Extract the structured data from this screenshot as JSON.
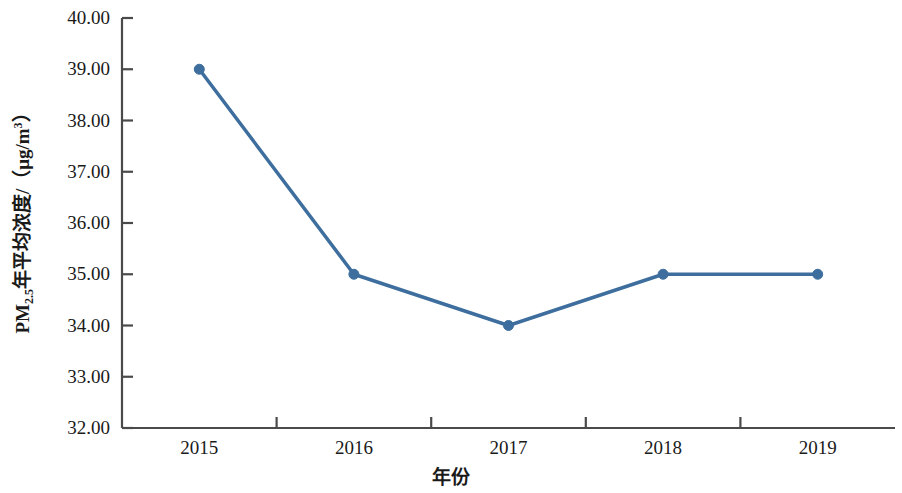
{
  "chart_data": {
    "type": "line",
    "title": "",
    "xlabel": "年份",
    "ylabel_html": "PM<sub>2.5</sub>年平均浓度/（μg/m<sup>3</sup>）",
    "ylabel_plain": "PM2.5年平均浓度/（μg/m3）",
    "categories": [
      "2015",
      "2016",
      "2017",
      "2018",
      "2019"
    ],
    "values": [
      39.0,
      35.0,
      34.0,
      35.0,
      35.0
    ],
    "series": [
      {
        "name": "PM2.5年平均浓度",
        "values": [
          39.0,
          35.0,
          34.0,
          35.0,
          35.0
        ],
        "color": "#3d6e9e",
        "marker": "circle",
        "line_width": 3.5,
        "marker_size": 10
      }
    ],
    "ylim": [
      32.0,
      40.0
    ],
    "ytick_step": 1.0,
    "ytick_labels": [
      "40.00",
      "39.00",
      "38.00",
      "37.00",
      "36.00",
      "35.00",
      "34.00",
      "33.00",
      "32.00"
    ],
    "ytick_values": [
      40.0,
      39.0,
      38.0,
      37.0,
      36.0,
      35.0,
      34.0,
      33.0,
      32.0
    ],
    "xtick_labels": [
      "2015",
      "2016",
      "2017",
      "2018",
      "2019"
    ],
    "grid": false,
    "legend": false,
    "legend_position": "none",
    "axis_color": "#4a4a4a",
    "background": "#ffffff"
  },
  "axis": {
    "y_title_parts": {
      "prefix": "PM",
      "subscript": "2.5",
      "middle": "年平均浓度/（μg/m",
      "superscript": "3",
      "suffix": "）"
    },
    "x_title": "年份"
  }
}
